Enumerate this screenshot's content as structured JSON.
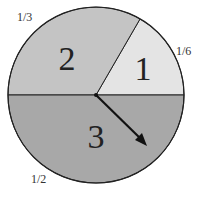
{
  "diagram": {
    "type": "spinner",
    "sectors": [
      {
        "label": "1",
        "fraction": "1/6",
        "fill": "#e4e4e4"
      },
      {
        "label": "2",
        "fraction": "1/3",
        "fill": "#c4c4c4"
      },
      {
        "label": "3",
        "fraction": "1/2",
        "fill": "#a8a8a8"
      }
    ],
    "pointer": "arrow pointing to sector 3"
  }
}
